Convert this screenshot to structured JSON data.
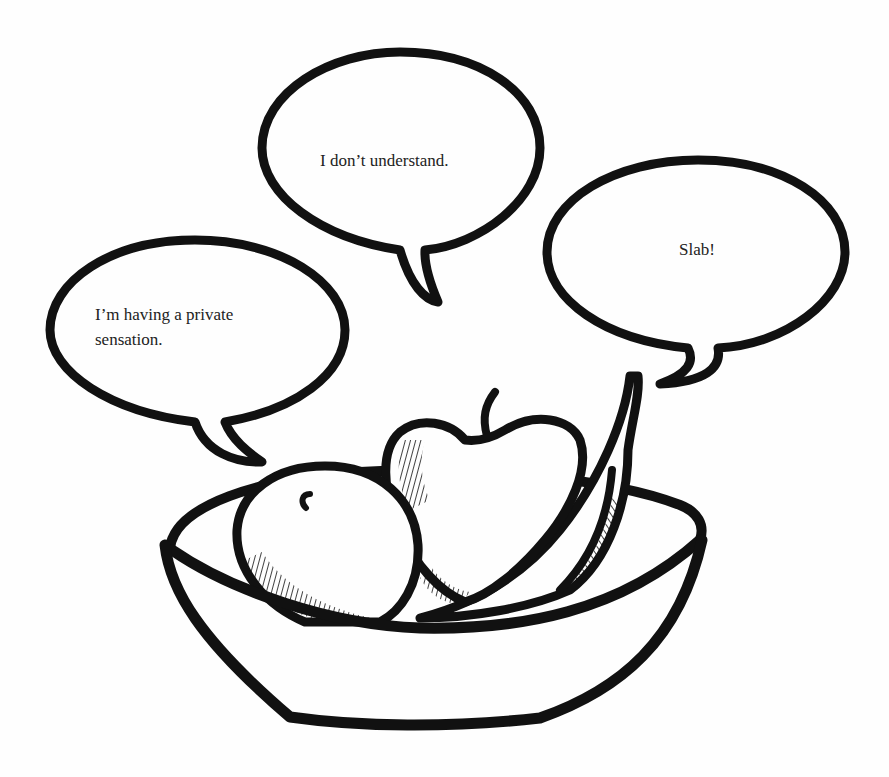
{
  "illustration": {
    "subject": "fruit bowl with talking fruit",
    "colors": {
      "ink": "#111111",
      "paper": "#fefefe",
      "text": "#222222"
    },
    "bubbles": [
      {
        "id": "left",
        "speaker": "orange",
        "text": "I’m having a private\nsensation."
      },
      {
        "id": "middle",
        "speaker": "apple",
        "text": "I don’t understand."
      },
      {
        "id": "right",
        "speaker": "banana",
        "text": "Slab!"
      }
    ],
    "fruits": [
      "orange",
      "apple",
      "banana"
    ],
    "container": "bowl"
  }
}
